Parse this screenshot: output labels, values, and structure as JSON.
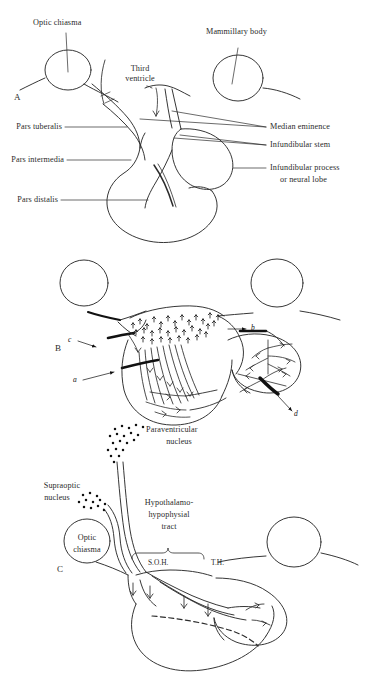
{
  "figure": {
    "background_color": "#ffffff",
    "ink_color": "#2b2b2b"
  },
  "panels": [
    {
      "letter": "A",
      "labels": {
        "optic_chiasma": "Optic chiasma",
        "mammillary_body": "Mammillary body",
        "third_ventricle_l1": "Third",
        "third_ventricle_l2": "ventricle",
        "pars_tuberalis": "Pars tuberalis",
        "pars_intermedia": "Pars intermedia",
        "pars_distalis": "Pars distalis",
        "median_eminence": "Median eminence",
        "infundibular_stem": "Infundibular stem",
        "infundibular_process_l1": "Infundibular process",
        "infundibular_process_l2": "or neural lobe"
      }
    },
    {
      "letter": "B",
      "labels": {
        "a": "a",
        "b": "b",
        "c": "c",
        "d": "d"
      }
    },
    {
      "letter": "C",
      "labels": {
        "paraventricular_l1": "Paraventricular",
        "paraventricular_l2": "nucleus",
        "supraoptic_l1": "Supraoptic",
        "supraoptic_l2": "nucleus",
        "optic_chiasma_l1": "Optic",
        "optic_chiasma_l2": "chiasma",
        "tract_l1": "Hypothalamo-",
        "tract_l2": "hypophysial",
        "tract_l3": "tract",
        "soh": "S.O.H.",
        "th": "T.H."
      }
    }
  ]
}
